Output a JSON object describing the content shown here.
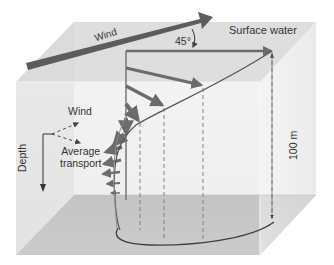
{
  "diagram": {
    "labels": {
      "main_wind": "Wind",
      "surface_water": "Surface water",
      "angle": "45°",
      "legend_wind": "Wind",
      "legend_average_line1": "Average",
      "legend_average_line2": "transport",
      "depth_axis": "Depth",
      "depth_scale": "100 m"
    },
    "colors": {
      "top_face": "#dcdcdc",
      "front_face": "#e6e6e6",
      "side_face": "#ededed",
      "floor": "#a8a8a8",
      "arrow": "#6b6b6b",
      "wind_arrow": "#5c5c5c",
      "curve": "#555555",
      "text": "#333333"
    }
  }
}
